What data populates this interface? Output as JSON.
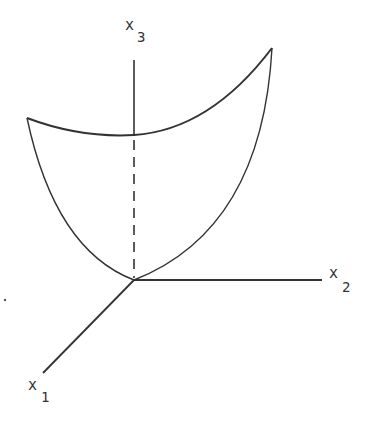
{
  "diagram": {
    "axes": {
      "x1": {
        "label": "x",
        "subscript": "1"
      },
      "x2": {
        "label": "x",
        "subscript": "2"
      },
      "x3": {
        "label": "x",
        "subscript": "3"
      }
    },
    "colors": {
      "stroke": "#333333",
      "background": "#ffffff"
    }
  }
}
